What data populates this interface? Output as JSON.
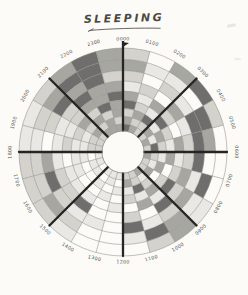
{
  "title": {
    "text": "SLEEPING"
  },
  "colors": {
    "paper": "#fcfbf8",
    "grid_thin": "#8f8d88",
    "grid_bold": "#262523",
    "label_text": "#55534f",
    "title_text": "#4a4946"
  },
  "chart_data": {
    "type": "heatmap",
    "subtype": "polar-24h-radial",
    "title": "SLEEPING",
    "hours": [
      "0000",
      "0100",
      "0200",
      "0300",
      "0400",
      "0500",
      "0600",
      "0700",
      "0800",
      "0900",
      "1000",
      "1100",
      "1200",
      "1300",
      "1400",
      "1500",
      "1600",
      "1700",
      "1800",
      "1900",
      "2000",
      "2100",
      "2200",
      "2300"
    ],
    "degrees_per_hour": 15,
    "bold_spoke_every_hours": 3,
    "rings": 9,
    "rows_order": "outer-to-inner",
    "inner_radius": 21,
    "outer_radius": 104,
    "ring_boundaries": [
      104,
      92.5,
      81.5,
      71,
      61,
      52,
      43.5,
      35.5,
      28,
      21
    ],
    "intensity_scale": [
      "none",
      "#e7e6e2",
      "#cfcec9",
      "#a09f99",
      "#636260"
    ],
    "values": [
      [
        2,
        0,
        3,
        4,
        2,
        0,
        0,
        0,
        1,
        3,
        2,
        0,
        0,
        0,
        1,
        2,
        2,
        2,
        1,
        1,
        2,
        3,
        4,
        3
      ],
      [
        3,
        1,
        1,
        0,
        4,
        3,
        0,
        4,
        1,
        3,
        4,
        1,
        0,
        0,
        2,
        3,
        2,
        2,
        1,
        2,
        3,
        4,
        4,
        3
      ],
      [
        2,
        0,
        2,
        1,
        4,
        4,
        4,
        1,
        3,
        2,
        1,
        4,
        0,
        1,
        1,
        2,
        4,
        3,
        0,
        2,
        4,
        3,
        4,
        2
      ],
      [
        1,
        2,
        0,
        3,
        1,
        2,
        2,
        3,
        2,
        4,
        0,
        2,
        0,
        0,
        4,
        2,
        2,
        1,
        1,
        1,
        2,
        4,
        3,
        3
      ],
      [
        3,
        1,
        3,
        2,
        0,
        3,
        1,
        2,
        4,
        1,
        3,
        0,
        1,
        0,
        1,
        1,
        1,
        0,
        2,
        1,
        2,
        3,
        3,
        4
      ],
      [
        4,
        2,
        1,
        4,
        2,
        1,
        3,
        0,
        2,
        3,
        1,
        2,
        0,
        1,
        0,
        0,
        1,
        1,
        1,
        2,
        3,
        2,
        4,
        3
      ],
      [
        2,
        3,
        4,
        1,
        3,
        2,
        1,
        3,
        0,
        2,
        4,
        1,
        1,
        0,
        1,
        0,
        0,
        1,
        1,
        1,
        2,
        3,
        2,
        3
      ],
      [
        3,
        2,
        2,
        3,
        1,
        4,
        2,
        1,
        3,
        1,
        2,
        3,
        0,
        1,
        0,
        1,
        1,
        0,
        2,
        2,
        3,
        2,
        3,
        2
      ],
      [
        4,
        3,
        2,
        2,
        3,
        2,
        3,
        2,
        2,
        3,
        2,
        2,
        1,
        1,
        1,
        0,
        1,
        1,
        2,
        2,
        2,
        3,
        3,
        3
      ]
    ],
    "axis_arrow": "up-at-0000",
    "legend": "none",
    "grid": "on"
  }
}
